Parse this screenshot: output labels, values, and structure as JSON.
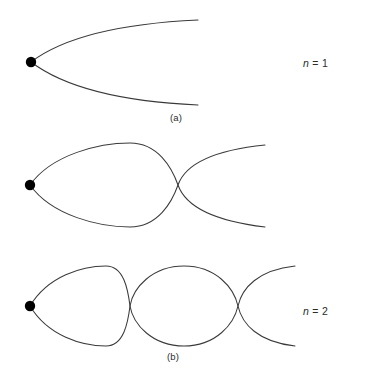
{
  "figure": {
    "background_color": "#ffffff",
    "stroke_color": "#3a3a3a",
    "dot_color": "#000000",
    "panels": [
      {
        "key": "a",
        "sub_label": "(a)",
        "n_variable": "n",
        "n_equals": "=",
        "n_value": "1",
        "n_label_full": "n = 1",
        "lobes": 1,
        "description": "single diverging lens-shaped beam from origin dot, open at right",
        "origin_dot": {
          "x": 31,
          "y": 62,
          "r": 5
        },
        "crossings": [],
        "right_end_x": 198,
        "upper_end_y": 20,
        "lower_end_y": 105,
        "amplitude": 42
      },
      {
        "key": "b",
        "sub_label": "(b)",
        "n_variable": "n",
        "n_equals": "=",
        "n_value": "2",
        "n_label_full": "n = 2",
        "lobes": 2,
        "description": "one closed lens lobe then a crossing node, curves diverge to the right",
        "origin_dot": {
          "x": 30,
          "y": 55,
          "r": 5
        },
        "crossings": [
          {
            "x": 178,
            "y": 55
          }
        ],
        "right_end_x": 265,
        "upper_end_y": 15,
        "lower_end_y": 97,
        "amplitude": 42
      },
      {
        "key": "c",
        "sub_label": "(c)",
        "n_variable": "n",
        "n_equals": "=",
        "n_value": "3",
        "n_label_full": "n = 3",
        "lobes": 3,
        "description": "two closed lens lobes with two crossing nodes, curves diverge to the right",
        "origin_dot": {
          "x": 30,
          "y": 58,
          "r": 5
        },
        "crossings": [
          {
            "x": 130,
            "y": 58
          },
          {
            "x": 238,
            "y": 58
          }
        ],
        "right_end_x": 295,
        "upper_end_y": 18,
        "lower_end_y": 98,
        "amplitude": 40
      }
    ]
  }
}
